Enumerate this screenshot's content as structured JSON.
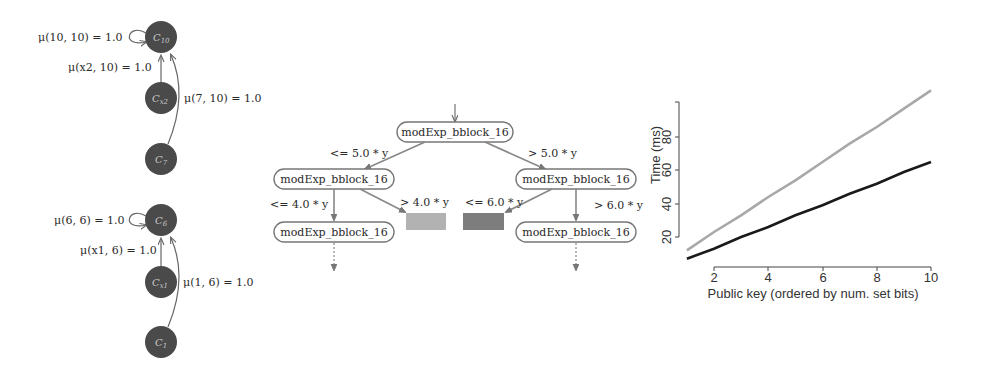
{
  "figure": {
    "markov_chains": {
      "top": {
        "nodes": [
          {
            "id": "C10",
            "label": "C",
            "sub": "10"
          },
          {
            "id": "Cx2",
            "label": "C",
            "sub": "x2"
          },
          {
            "id": "C7",
            "label": "C",
            "sub": "7"
          }
        ],
        "edges": [
          {
            "from": "C10",
            "to": "C10",
            "label": "μ(10, 10) = 1.0"
          },
          {
            "from": "Cx2",
            "to": "C10",
            "label": "μ(x2, 10) = 1.0"
          },
          {
            "from": "C7",
            "to": "C10",
            "label": "μ(7, 10) = 1.0"
          }
        ]
      },
      "bottom": {
        "nodes": [
          {
            "id": "C6",
            "label": "C",
            "sub": "6"
          },
          {
            "id": "Cx1",
            "label": "C",
            "sub": "x1"
          },
          {
            "id": "C1",
            "label": "C",
            "sub": "1"
          }
        ],
        "edges": [
          {
            "from": "C6",
            "to": "C6",
            "label": "μ(6, 6) = 1.0"
          },
          {
            "from": "Cx1",
            "to": "C6",
            "label": "μ(x1, 6) = 1.0"
          },
          {
            "from": "C1",
            "to": "C6",
            "label": "μ(1, 6) = 1.0"
          }
        ]
      }
    },
    "decision_tree": {
      "root": "modExp_bblock_16",
      "left": "modExp_bblock_16",
      "right": "modExp_bblock_16",
      "left_left": "modExp_bblock_16",
      "right_right": "modExp_bblock_16",
      "edge_labels": {
        "root_left": "<= 5.0 * y",
        "root_right": "> 5.0 * y",
        "left_left": "<= 4.0 * y",
        "left_leaf": "> 4.0 * y",
        "right_leaf": "<= 6.0 * y",
        "right_right": "> 6.0 * y"
      },
      "leaf_colors": {
        "light": "#b2b2b2",
        "dark": "#7d7d7d"
      }
    }
  },
  "chart_data": {
    "type": "line",
    "title": "",
    "xlabel": "Public key (ordered by num. set bits)",
    "ylabel": "Time (ms)",
    "x": [
      1,
      2,
      3,
      4,
      5,
      6,
      7,
      8,
      9,
      10
    ],
    "xticks": [
      "2",
      "4",
      "6",
      "8",
      "10"
    ],
    "yticks": [
      "20",
      "40",
      "60",
      "80"
    ],
    "xlim": [
      1,
      10
    ],
    "ylim": [
      0,
      100
    ],
    "grid": false,
    "series": [
      {
        "name": "gray (upper)",
        "color": "#a8a8a8",
        "values": [
          12,
          23,
          33,
          44,
          54,
          65,
          76,
          86,
          97,
          108
        ]
      },
      {
        "name": "black (lower)",
        "color": "#1a1a1a",
        "values": [
          7,
          13,
          20,
          26,
          33,
          39,
          46,
          52,
          59,
          65
        ]
      }
    ]
  }
}
